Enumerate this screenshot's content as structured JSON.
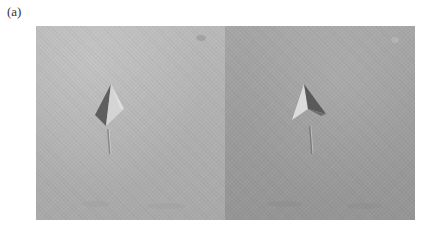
{
  "figure": {
    "label": "(a)",
    "panels": [
      {
        "name": "left",
        "feature": "pyramid-indentation"
      },
      {
        "name": "right",
        "feature": "pyramid-indentation"
      }
    ]
  }
}
